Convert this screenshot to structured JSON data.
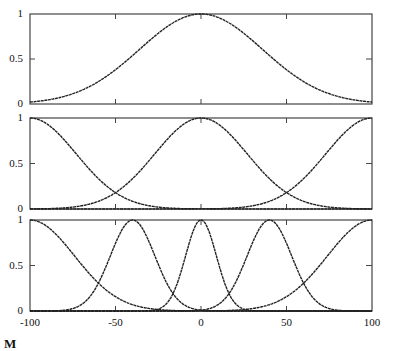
{
  "figure": {
    "ink_color": "#222222",
    "frame_color": "#444444",
    "background": "#ffffff",
    "bottom_fragment": "M"
  },
  "chart_data": [
    {
      "type": "line",
      "title": "",
      "xlabel": "",
      "ylabel": "",
      "xlim": [
        -100,
        100
      ],
      "ylim": [
        0,
        1
      ],
      "yticks": [
        "0",
        "0.5",
        "1"
      ],
      "xticks": [
        -100,
        -50,
        0,
        50,
        100
      ],
      "grid": false,
      "legend": null,
      "series": [
        {
          "name": "gaussian-center-0",
          "center": 0,
          "sigma": 36
        }
      ]
    },
    {
      "type": "line",
      "title": "",
      "xlabel": "",
      "ylabel": "",
      "xlim": [
        -100,
        100
      ],
      "ylim": [
        0,
        1
      ],
      "yticks": [
        "0",
        "0.5",
        "1"
      ],
      "xticks": [
        -100,
        -50,
        0,
        50,
        100
      ],
      "grid": false,
      "legend": null,
      "series": [
        {
          "name": "gaussian-center-minus100",
          "center": -100,
          "sigma": 27
        },
        {
          "name": "gaussian-center-0",
          "center": 0,
          "sigma": 27
        },
        {
          "name": "gaussian-center-100",
          "center": 100,
          "sigma": 27
        }
      ]
    },
    {
      "type": "line",
      "title": "",
      "xlabel": "",
      "ylabel": "",
      "xlim": [
        -100,
        100
      ],
      "ylim": [
        0,
        1
      ],
      "yticks": [
        "0",
        "0.5",
        "1"
      ],
      "xticks": [
        "-100",
        "-50",
        "0",
        "50",
        "100"
      ],
      "grid": false,
      "legend": null,
      "series": [
        {
          "name": "gaussian-center-minus100",
          "center": -100,
          "sigma": 26
        },
        {
          "name": "gaussian-center-minus40",
          "center": -40,
          "sigma": 13
        },
        {
          "name": "gaussian-center-0",
          "center": 0,
          "sigma": 9
        },
        {
          "name": "gaussian-center-40",
          "center": 40,
          "sigma": 13
        },
        {
          "name": "gaussian-center-100",
          "center": 100,
          "sigma": 26
        }
      ]
    }
  ]
}
